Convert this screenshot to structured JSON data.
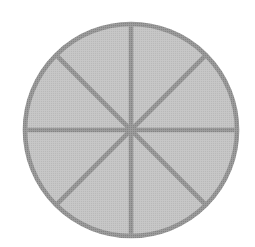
{
  "figure": {
    "title": "Circle divided into eight equal sectors",
    "kind": "fraction-circle",
    "background_color": "#ffffff",
    "canvas": {
      "width": 255,
      "height": 247
    }
  },
  "chart_data": {
    "type": "pie",
    "title": "",
    "subtitle": "",
    "xlabel": "",
    "ylabel": "",
    "legend": [],
    "legend_position": "none",
    "grid": false,
    "labels": [
      "1/8",
      "1/8",
      "1/8",
      "1/8",
      "1/8",
      "1/8",
      "1/8",
      "1/8"
    ],
    "values": [
      12.5,
      12.5,
      12.5,
      12.5,
      12.5,
      12.5,
      12.5,
      12.5
    ],
    "slice_count": 8,
    "slice_angle_degrees": 45,
    "slice_fraction": "1/8",
    "total": 100,
    "shaded_count": 0,
    "all_slices_same_color": true,
    "annotations": []
  },
  "geometry": {
    "center_x": 131,
    "center_y": 130,
    "radius": 106,
    "stroke_width": 4.6,
    "divider_count": 4,
    "divider_angles_degrees": [
      0,
      45,
      90,
      135
    ]
  },
  "colors": {
    "fill": "#b9b9b9",
    "stroke": "#838383",
    "divider": "#838383",
    "background": "#ffffff"
  },
  "dividers": [
    {
      "name": "vertical-diameter",
      "angle": 90,
      "x1": 131,
      "y1": 24,
      "x2": 131,
      "y2": 236
    },
    {
      "name": "horizontal-diameter",
      "angle": 0,
      "x1": 25,
      "y1": 130,
      "x2": 237,
      "y2": 130
    },
    {
      "name": "diagonal-diameter-nw-se",
      "angle": 135,
      "x1": 56,
      "y1": 55,
      "x2": 206,
      "y2": 205
    },
    {
      "name": "diagonal-diameter-ne-sw",
      "angle": 45,
      "x1": 206,
      "y1": 55,
      "x2": 56,
      "y2": 205
    }
  ]
}
